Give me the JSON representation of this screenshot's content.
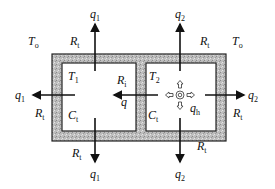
{
  "diagram": {
    "ambient": {
      "left": "T",
      "left_sub": "o",
      "right": "T",
      "right_sub": "o"
    },
    "zones": [
      {
        "temp": "T",
        "temp_sub": "1",
        "capacitance": "C",
        "capacitance_sub": "t"
      },
      {
        "temp": "T",
        "temp_sub": "2",
        "capacitance": "C",
        "capacitance_sub": "t"
      }
    ],
    "resistances": {
      "wall": "R",
      "wall_sub": "t",
      "internal": "R",
      "internal_sub": "i"
    },
    "flows": {
      "q1": "q",
      "q1_sub": "1",
      "q2": "q",
      "q2_sub": "2",
      "q": "q",
      "qh": "q",
      "qh_sub": "h"
    },
    "colors": {
      "wall_fill": "#b8b8b8",
      "stroke": "#111111",
      "background": "#ffffff"
    }
  }
}
